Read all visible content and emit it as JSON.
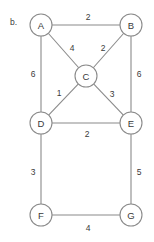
{
  "figure": {
    "caption": "b.",
    "colors": {
      "stroke": "#8a8a8a",
      "text": "#3a3a3a",
      "background": "#ffffff"
    }
  },
  "chart_data": {
    "type": "diagram",
    "title": "b.",
    "graph_kind": "undirected weighted graph",
    "nodes": [
      {
        "id": "A",
        "label": "A",
        "x": 41,
        "y": 25,
        "r": 11
      },
      {
        "id": "B",
        "label": "B",
        "x": 131,
        "y": 25,
        "r": 11
      },
      {
        "id": "C",
        "label": "C",
        "x": 86,
        "y": 76,
        "r": 11
      },
      {
        "id": "D",
        "label": "D",
        "x": 41,
        "y": 123,
        "r": 11
      },
      {
        "id": "E",
        "label": "E",
        "x": 131,
        "y": 123,
        "r": 11
      },
      {
        "id": "F",
        "label": "F",
        "x": 41,
        "y": 215,
        "r": 11
      },
      {
        "id": "G",
        "label": "G",
        "x": 131,
        "y": 215,
        "r": 11
      }
    ],
    "edges": [
      {
        "from": "A",
        "to": "B",
        "weight": 2,
        "label_x": 88,
        "label_y": 17
      },
      {
        "from": "A",
        "to": "C",
        "weight": 4,
        "label_x": 72,
        "label_y": 48
      },
      {
        "from": "B",
        "to": "C",
        "weight": 2,
        "label_x": 103,
        "label_y": 48
      },
      {
        "from": "A",
        "to": "D",
        "weight": 6,
        "label_x": 33,
        "label_y": 74
      },
      {
        "from": "B",
        "to": "E",
        "weight": 6,
        "label_x": 139,
        "label_y": 74
      },
      {
        "from": "C",
        "to": "D",
        "weight": 1,
        "label_x": 59,
        "label_y": 93
      },
      {
        "from": "C",
        "to": "E",
        "weight": 3,
        "label_x": 112,
        "label_y": 94
      },
      {
        "from": "D",
        "to": "E",
        "weight": 2,
        "label_x": 87,
        "label_y": 134
      },
      {
        "from": "D",
        "to": "F",
        "weight": 3,
        "label_x": 33,
        "label_y": 172
      },
      {
        "from": "E",
        "to": "G",
        "weight": 5,
        "label_x": 139,
        "label_y": 172
      },
      {
        "from": "F",
        "to": "G",
        "weight": 4,
        "label_x": 88,
        "label_y": 228
      }
    ]
  }
}
